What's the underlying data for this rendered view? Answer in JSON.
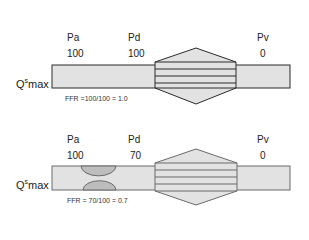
{
  "diagrams": [
    {
      "id": "normal",
      "labels": {
        "pa": {
          "name": "Pa",
          "value": "100"
        },
        "pd": {
          "name": "Pd",
          "value": "100"
        },
        "pv": {
          "name": "Pv",
          "value": "0"
        }
      },
      "flow_label": {
        "base": "Q",
        "sup": "s",
        "sub": "max"
      },
      "ffr_text": "FFR =100/100 = 1.0",
      "stenosis": false
    },
    {
      "id": "stenosis",
      "labels": {
        "pa": {
          "name": "Pa",
          "value": "100"
        },
        "pd": {
          "name": "Pd",
          "value": "70"
        },
        "pv": {
          "name": "Pv",
          "value": "0"
        }
      },
      "flow_label": {
        "base": "Q",
        "sup": "s",
        "sub": "max"
      },
      "ffr_text": "FFR = 70/100 = 0.7",
      "stenosis": true
    }
  ],
  "colors": {
    "tube_fill": "#e2e2e2",
    "stroke_dark": "#2a2a2a",
    "stroke_grey": "#6a6a6a",
    "stenosis_fill": "#bdbdbd"
  }
}
